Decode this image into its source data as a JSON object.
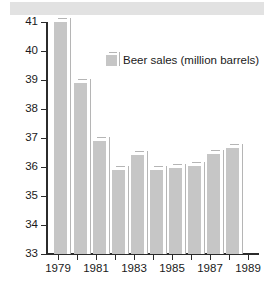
{
  "chart_data": {
    "type": "bar",
    "title": "",
    "subtitle": "",
    "xlabel": "",
    "ylabel": "",
    "ylim": [
      33,
      41
    ],
    "xlim": [
      1978.5,
      1989.5
    ],
    "grid": false,
    "legend_position": "top-center",
    "legend": [
      "Beer sales (million barrels)"
    ],
    "series": [
      {
        "name": "Beer sales (million barrels)",
        "color": "#c6c6c6",
        "values": [
          41.0,
          38.9,
          36.9,
          35.9,
          36.4,
          35.9,
          35.95,
          36.05,
          36.45,
          36.65
        ]
      }
    ],
    "categories": [
      "1979",
      "1980",
      "1981",
      "1982",
      "1983",
      "1984",
      "1985",
      "1986",
      "1987",
      "1988"
    ],
    "x_tick_labels": [
      "1979",
      "1981",
      "1983",
      "1985",
      "1987",
      "1989"
    ],
    "x_tick_values": [
      1979,
      1981,
      1983,
      1985,
      1987,
      1989
    ],
    "x_minor_ticks": [
      1980,
      1982,
      1984,
      1986,
      1988
    ],
    "y_tick_labels": [
      "41",
      "40",
      "39",
      "38",
      "37",
      "36",
      "35",
      "34",
      "33"
    ],
    "y_tick_values": [
      41,
      40,
      39,
      38,
      37,
      36,
      35,
      34,
      33
    ]
  },
  "legend": {
    "swatch_color": "#c6c6c6",
    "label": "Beer sales (million barrels)"
  },
  "axes": {
    "axis_color": "#2b2b2b"
  }
}
